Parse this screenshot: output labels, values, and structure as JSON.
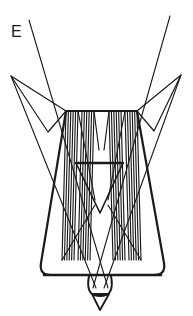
{
  "figure": {
    "label": "E",
    "domain": "technical-line-drawing",
    "caption_letter": "E",
    "background_color": "#ffffff",
    "ink_color": "#1a1a1a",
    "canvas": {
      "width": 193,
      "height": 316
    },
    "parts": {
      "outer_body": "trapezoidal-housing-with-rounded-bottom-corners",
      "wings": "two-upper-triangular-flanges",
      "rays": "two-long-crossing-diagonal-rays",
      "hatch_bands": "four-hatched-funnel-bands",
      "inner_triangle": "central-inverted-triangle",
      "nozzle": "bottom-rounded-nozzle-with-pointed-tip"
    }
  },
  "geometry": {
    "outer_body": {
      "top_left": [
        66,
        111
      ],
      "top_right": [
        137,
        111
      ],
      "bottom_left": [
        33,
        275
      ],
      "bottom_right": [
        170,
        275
      ],
      "corner_radius": 12,
      "stroke_width": 2.2
    },
    "top_edge": {
      "from": [
        66,
        111
      ],
      "to": [
        137,
        111
      ],
      "stroke_width": 2.0
    },
    "bottom_edge": {
      "from": [
        45,
        275
      ],
      "to": [
        160,
        275
      ],
      "stroke_width": 2.4
    },
    "left_wing": {
      "tip": [
        11,
        76
      ],
      "inner_top": [
        66,
        111
      ],
      "lower": [
        48,
        132
      ]
    },
    "right_wing": {
      "tip": [
        181,
        75
      ],
      "inner_top": [
        137,
        111
      ],
      "lower": [
        154,
        131
      ]
    },
    "ray_left": {
      "from": [
        29,
        20
      ],
      "to": [
        108,
        288
      ]
    },
    "ray_right": {
      "from": [
        170,
        16
      ],
      "to": [
        93,
        288
      ]
    },
    "ray_wing_left": {
      "from": [
        11,
        76
      ],
      "to": [
        96,
        288
      ]
    },
    "ray_wing_right": {
      "from": [
        181,
        75
      ],
      "to": [
        104,
        288
      ]
    },
    "inner_triangle": {
      "left": [
        76,
        163
      ],
      "right": [
        123,
        163
      ],
      "apex": [
        100,
        213
      ],
      "stroke_width": 2.0
    },
    "hatch_band_outer_left": {
      "top_from": [
        66,
        111
      ],
      "top_to": [
        78,
        111
      ],
      "bottom_from": [
        62,
        260
      ],
      "bottom_to": [
        74,
        260
      ],
      "line_count": 6
    },
    "hatch_band_inner_left": {
      "top_from": [
        82,
        111
      ],
      "top_to": [
        94,
        111
      ],
      "bottom_from": [
        78,
        260
      ],
      "bottom_to": [
        90,
        260
      ],
      "line_count": 6
    },
    "hatch_band_inner_right": {
      "top_from": [
        109,
        111
      ],
      "top_to": [
        121,
        111
      ],
      "bottom_from": [
        113,
        260
      ],
      "bottom_to": [
        125,
        260
      ],
      "line_count": 6
    },
    "hatch_band_outer_right": {
      "top_from": [
        125,
        111
      ],
      "top_to": [
        137,
        111
      ],
      "bottom_from": [
        129,
        260
      ],
      "bottom_to": [
        141,
        260
      ],
      "line_count": 6
    },
    "nozzle": {
      "body_center": [
        100,
        285
      ],
      "body_rx": 11,
      "body_ry": 12,
      "tip_left": [
        92,
        292
      ],
      "tip_right": [
        109,
        292
      ],
      "tip_point": [
        100,
        309
      ]
    }
  }
}
